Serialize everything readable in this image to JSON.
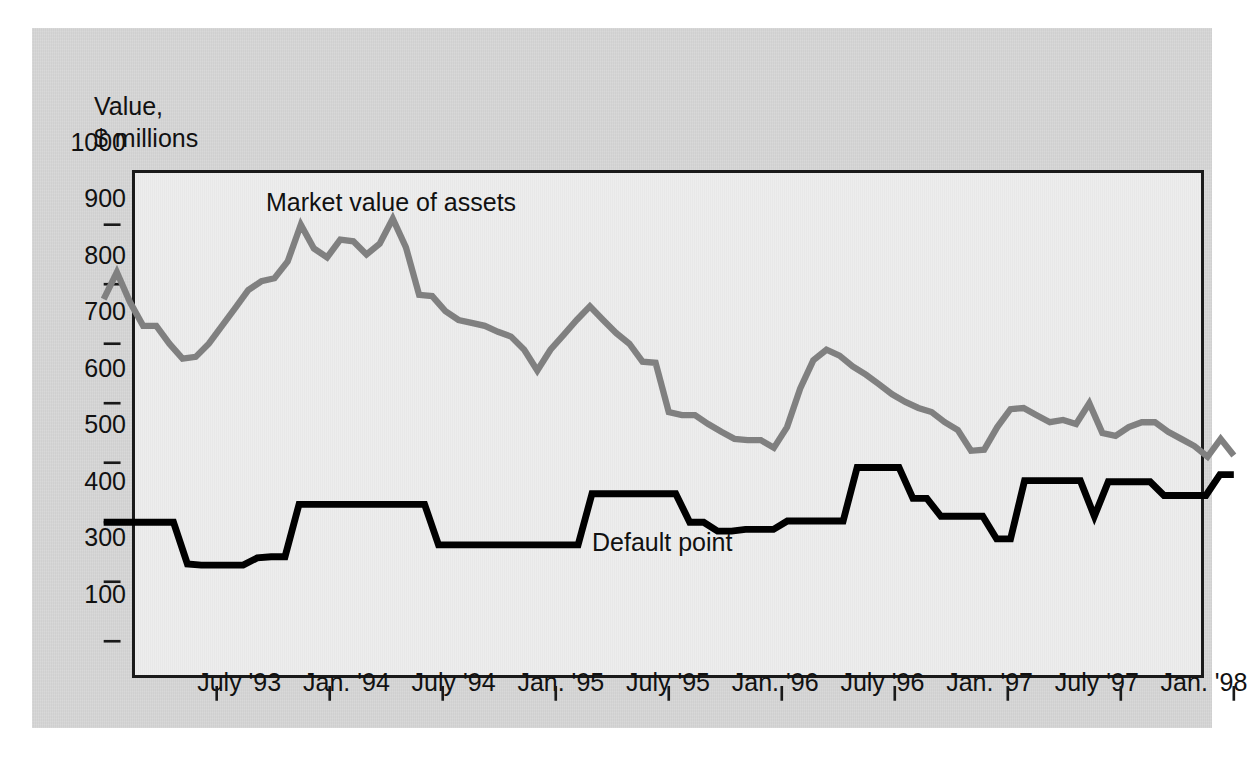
{
  "axis_caption": "Value,\n$ millions",
  "series_labels": {
    "market": "Market value of assets",
    "default": "Default point"
  },
  "y_ticks": [
    "1000",
    "900",
    "800",
    "700",
    "600",
    "500",
    "400",
    "300",
    "100"
  ],
  "x_ticks": [
    "July '93",
    "Jan. '94",
    "July '94",
    "Jan. '95",
    "July '95",
    "Jan. '96",
    "July '96",
    "Jan. '97",
    "July '97",
    "Jan. '98"
  ],
  "colors": {
    "market_line": "#808080",
    "default_line": "#000000",
    "panel": "#d6d6d6",
    "plot_bg": "#ebebeb",
    "frame": "#1a1a1a",
    "text": "#111111"
  },
  "chart_data": {
    "type": "line",
    "title": "",
    "xlabel": "",
    "ylabel": "Value, $ millions",
    "ylim": [
      100,
      1000
    ],
    "y_ticks": [
      1000,
      900,
      800,
      700,
      600,
      500,
      400,
      300,
      100
    ],
    "grid": false,
    "legend": "inline-annotations",
    "x_tick_labels": [
      "July '93",
      "Jan. '94",
      "July '94",
      "Jan. '95",
      "July '95",
      "Jan. '96",
      "July '96",
      "Jan. '97",
      "July '97",
      "Jan. '98"
    ],
    "x_tick_index": [
      6,
      12,
      18,
      24,
      30,
      36,
      42,
      48,
      54,
      60
    ],
    "x_start_label": "Jan. '93",
    "x_end_label": "Jan. '98",
    "n_points": 61,
    "series": [
      {
        "name": "Market value of assets",
        "color": "#808080",
        "values": [
          775,
          820,
          770,
          730,
          730,
          700,
          675,
          678,
          700,
          730,
          760,
          790,
          805,
          810,
          838,
          900,
          860,
          845,
          875,
          872,
          850,
          868,
          910,
          862,
          782,
          780,
          755,
          740,
          735,
          730,
          720,
          712,
          690,
          655,
          690,
          715,
          740,
          763,
          740,
          718,
          700,
          670,
          668,
          585,
          580,
          580,
          565,
          552,
          540,
          538,
          538,
          525,
          560,
          625,
          672,
          690,
          680,
          662,
          648,
          632,
          615,
          602,
          592,
          585,
          568,
          555,
          520,
          522,
          560,
          590,
          592,
          580,
          568,
          572,
          565,
          600,
          550,
          545,
          560,
          568,
          568,
          552,
          540,
          528,
          510,
          540,
          512
        ]
      },
      {
        "name": "Default point",
        "color": "#000000",
        "values": [
          400,
          400,
          400,
          400,
          400,
          400,
          330,
          328,
          328,
          328,
          328,
          340,
          342,
          342,
          430,
          430,
          430,
          430,
          430,
          430,
          430,
          430,
          430,
          430,
          362,
          362,
          362,
          362,
          362,
          362,
          362,
          362,
          362,
          362,
          362,
          448,
          448,
          448,
          448,
          448,
          448,
          448,
          400,
          400,
          385,
          385,
          388,
          388,
          388,
          402,
          402,
          402,
          402,
          402,
          492,
          492,
          492,
          492,
          440,
          440,
          410,
          410,
          410,
          410,
          372,
          372,
          470,
          470,
          470,
          470,
          470,
          410,
          468,
          468,
          468,
          468,
          445,
          445,
          445,
          445,
          480,
          480
        ]
      }
    ]
  }
}
